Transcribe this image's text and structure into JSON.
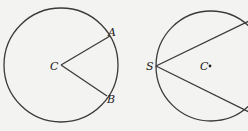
{
  "figures": [
    {
      "name": "circle-with-central-angle",
      "labels": {
        "center": "C",
        "point_a": "A",
        "point_b": "B"
      }
    },
    {
      "name": "circle-with-inscribed-angle",
      "labels": {
        "center": "C",
        "vertex": "S"
      }
    }
  ],
  "colors": {
    "stroke": "#3a3a3a",
    "background": "#f3f3f1"
  }
}
